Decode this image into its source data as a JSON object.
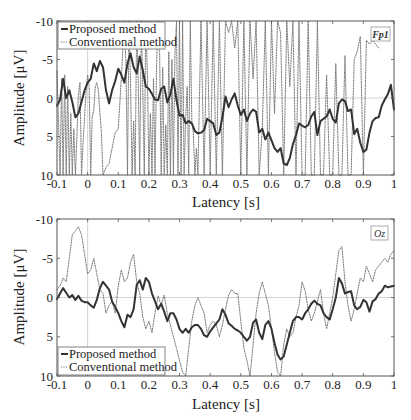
{
  "chart_data": [
    {
      "type": "line",
      "panel": "top",
      "channel_label": "Fp1",
      "xlabel": "Latency [s]",
      "ylabel": "Amplitude [μV]",
      "xlim": [
        -0.1,
        1.0
      ],
      "ylim": [
        -10,
        10
      ],
      "y_reversed": true,
      "x_ticks": [
        -0.1,
        0,
        0.1,
        0.2,
        0.3,
        0.4,
        0.5,
        0.6,
        0.7,
        0.8,
        0.9,
        1
      ],
      "x_tick_labels": [
        "-0.1",
        "0",
        "0.1",
        "0.2",
        "0.3",
        "0.4",
        "0.5",
        "0.6",
        "0.7",
        "0.8",
        "0.9",
        "1"
      ],
      "y_ticks": [
        -10,
        -5,
        0,
        5,
        10
      ],
      "y_tick_labels": [
        "-10",
        "-5",
        "0",
        "5",
        "10"
      ],
      "grid": "zero-lines",
      "legend_position": "upper left",
      "series": [
        {
          "name": "Proposed method",
          "style": "solid",
          "x": [
            -0.1,
            -0.09,
            -0.08,
            -0.07,
            -0.06,
            -0.05,
            -0.04,
            -0.03,
            -0.02,
            -0.01,
            0,
            0.01,
            0.02,
            0.03,
            0.04,
            0.05,
            0.06,
            0.07,
            0.08,
            0.09,
            0.1,
            0.11,
            0.12,
            0.13,
            0.14,
            0.15,
            0.16,
            0.17,
            0.18,
            0.19,
            0.2,
            0.21,
            0.22,
            0.23,
            0.24,
            0.25,
            0.26,
            0.27,
            0.28,
            0.29,
            0.3,
            0.31,
            0.32,
            0.33,
            0.34,
            0.35,
            0.36,
            0.37,
            0.38,
            0.39,
            0.4,
            0.41,
            0.42,
            0.43,
            0.44,
            0.45,
            0.46,
            0.47,
            0.48,
            0.49,
            0.5,
            0.51,
            0.52,
            0.53,
            0.54,
            0.55,
            0.56,
            0.57,
            0.58,
            0.59,
            0.6,
            0.61,
            0.62,
            0.63,
            0.64,
            0.65,
            0.66,
            0.67,
            0.68,
            0.69,
            0.7,
            0.71,
            0.72,
            0.73,
            0.74,
            0.75,
            0.76,
            0.77,
            0.78,
            0.79,
            0.8,
            0.81,
            0.82,
            0.83,
            0.84,
            0.85,
            0.86,
            0.87,
            0.88,
            0.89,
            0.9,
            0.91,
            0.92,
            0.93,
            0.94,
            0.95,
            0.96,
            0.97,
            0.98,
            0.99,
            1.0
          ],
          "y": [
            1.0,
            0.2,
            -2.5,
            0.0,
            -1.0,
            0.5,
            2.5,
            2.0,
            0.5,
            -1.0,
            -2.0,
            -2.5,
            -4.5,
            -3.5,
            -4.8,
            -4.0,
            -1.0,
            0.7,
            -1.0,
            -2.2,
            -3.8,
            -3.0,
            -2.0,
            -4.5,
            -5.8,
            -4.0,
            -3.2,
            -5.4,
            -3.6,
            -1.5,
            -1.2,
            -0.5,
            0.2,
            0.3,
            -1.2,
            -1.5,
            0.6,
            -0.5,
            -2.5,
            0.3,
            2.3,
            2.2,
            3.3,
            3.0,
            3.3,
            4.3,
            4.6,
            4.5,
            4.2,
            2.7,
            3.0,
            3.3,
            4.8,
            4.5,
            2.5,
            -0.2,
            1.2,
            0.2,
            -0.6,
            1.0,
            2.2,
            1.5,
            3.0,
            2.0,
            1.5,
            1.8,
            4.5,
            4.0,
            5.4,
            4.5,
            5.5,
            6.5,
            7.0,
            6.5,
            8.5,
            8.7,
            7.8,
            6.0,
            4.8,
            3.3,
            3.6,
            3.8,
            3.5,
            2.4,
            1.8,
            4.8,
            3.0,
            2.7,
            2.4,
            1.5,
            2.7,
            3.2,
            0.7,
            0.2,
            0.4,
            1.7,
            1.5,
            4.7,
            4.0,
            5.8,
            7.0,
            6.7,
            4.5,
            3.0,
            2.6,
            2.5,
            1.0,
            0.2,
            -0.5,
            -1.7,
            1.5
          ]
        },
        {
          "name": "Conventional method",
          "style": "dotted",
          "description": "highly oscillatory, frequently clipped at both axis limits",
          "x": [
            -0.1,
            -0.09,
            -0.085,
            -0.08,
            -0.075,
            -0.07,
            -0.065,
            -0.06,
            -0.055,
            -0.05,
            -0.045,
            -0.04,
            -0.035,
            -0.03,
            -0.025,
            -0.02,
            -0.015,
            -0.01,
            -0.005,
            0,
            0.005,
            0.01,
            0.015,
            0.02,
            0.025,
            0.03,
            0.035,
            0.04,
            0.045,
            0.05,
            0.06,
            0.07,
            0.08,
            0.09,
            0.1,
            0.11,
            0.12,
            0.125,
            0.13,
            0.135,
            0.14,
            0.145,
            0.15,
            0.155,
            0.16,
            0.165,
            0.17,
            0.175,
            0.18,
            0.185,
            0.19,
            0.195,
            0.2,
            0.205,
            0.21,
            0.215,
            0.22,
            0.225,
            0.23,
            0.235,
            0.24,
            0.245,
            0.25,
            0.255,
            0.26,
            0.265,
            0.27,
            0.275,
            0.28,
            0.285,
            0.29,
            0.295,
            0.3,
            0.305,
            0.31,
            0.315,
            0.32,
            0.325,
            0.33,
            0.335,
            0.34,
            0.345,
            0.35,
            0.355,
            0.36,
            0.37,
            0.38,
            0.39,
            0.4,
            0.41,
            0.42,
            0.43,
            0.44,
            0.45,
            0.46,
            0.47,
            0.48,
            0.49,
            0.5,
            0.51,
            0.52,
            0.53,
            0.54,
            0.55,
            0.56,
            0.57,
            0.58,
            0.59,
            0.6,
            0.61,
            0.62,
            0.63,
            0.64,
            0.65,
            0.66,
            0.67,
            0.68,
            0.69,
            0.7,
            0.71,
            0.72,
            0.73,
            0.74,
            0.75,
            0.76,
            0.77,
            0.78,
            0.79,
            0.8,
            0.81,
            0.82,
            0.83,
            0.84,
            0.85,
            0.86,
            0.87,
            0.88,
            0.89,
            0.9,
            0.91,
            0.92,
            0.93,
            0.94,
            0.95,
            0.96,
            0.97,
            0.98,
            0.99,
            1.0
          ],
          "y": [
            -3.5,
            10,
            -2.5,
            10,
            -3.0,
            10,
            -1.5,
            10,
            2.0,
            10,
            4.0,
            10,
            5.0,
            -0.5,
            -2.0,
            10,
            6.0,
            2.5,
            -1.0,
            -3.0,
            -1.5,
            10,
            2.5,
            1.5,
            -1.5,
            -2.0,
            -1.0,
            2.0,
            4.5,
            10,
            9.0,
            8.5,
            6.5,
            4.5,
            4.0,
            -2.5,
            -10,
            -4.5,
            10,
            -10,
            -2.0,
            10,
            3.0,
            10,
            -10,
            -2.5,
            10,
            -10,
            -1.0,
            10,
            -10,
            -3.0,
            10,
            2.0,
            10,
            -2.5,
            10,
            -4.5,
            -10,
            -6.0,
            10,
            -4.0,
            10,
            3.5,
            10,
            -6.0,
            10,
            -5.0,
            10,
            -5.5,
            -10,
            10,
            -10,
            10,
            -10,
            10,
            2.5,
            -1.5,
            10,
            -10,
            3.0,
            4.5,
            10,
            6.5,
            10,
            -10,
            10,
            -10,
            10,
            -10,
            10,
            -10,
            10,
            -10,
            -8.5,
            -10,
            -6.5,
            -10,
            10,
            -10,
            10,
            -10,
            -2.5,
            -10,
            10,
            4.0,
            -10,
            10,
            -10,
            2.0,
            -10,
            -8.5,
            10,
            -10,
            -1.5,
            -10,
            10,
            -10,
            10,
            10,
            -10,
            10,
            10,
            -10,
            10,
            10,
            -3.0,
            10,
            10,
            -4.5,
            10,
            10,
            -5.5,
            10,
            10,
            -5.0,
            -6.0,
            -8.0,
            10,
            -7.5,
            -7.0,
            -7.5,
            -7.0,
            -6.5
          ]
        }
      ]
    },
    {
      "type": "line",
      "panel": "bottom",
      "channel_label": "Oz",
      "xlabel": "Latency [s]",
      "ylabel": "Amplitude [μV]",
      "xlim": [
        -0.1,
        1.0
      ],
      "ylim": [
        -10,
        10
      ],
      "y_reversed": true,
      "x_ticks": [
        -0.1,
        0,
        0.1,
        0.2,
        0.3,
        0.4,
        0.5,
        0.6,
        0.7,
        0.8,
        0.9,
        1
      ],
      "x_tick_labels": [
        "-0.1",
        "0",
        "0.1",
        "0.2",
        "0.3",
        "0.4",
        "0.5",
        "0.6",
        "0.7",
        "0.8",
        "0.9",
        "1"
      ],
      "y_ticks": [
        -10,
        -5,
        0,
        5,
        10
      ],
      "y_tick_labels": [
        "-10",
        "-5",
        "0",
        "5",
        "10"
      ],
      "grid": "zero-lines",
      "legend_position": "lower left",
      "series": [
        {
          "name": "Proposed method",
          "style": "solid",
          "x": [
            -0.1,
            -0.09,
            -0.08,
            -0.07,
            -0.06,
            -0.05,
            -0.04,
            -0.03,
            -0.02,
            -0.01,
            0,
            0.01,
            0.02,
            0.03,
            0.04,
            0.05,
            0.06,
            0.07,
            0.08,
            0.09,
            0.1,
            0.11,
            0.12,
            0.13,
            0.14,
            0.15,
            0.16,
            0.17,
            0.18,
            0.19,
            0.2,
            0.21,
            0.22,
            0.23,
            0.24,
            0.25,
            0.26,
            0.27,
            0.28,
            0.29,
            0.3,
            0.31,
            0.32,
            0.33,
            0.34,
            0.35,
            0.36,
            0.37,
            0.38,
            0.39,
            0.4,
            0.41,
            0.42,
            0.43,
            0.44,
            0.45,
            0.46,
            0.47,
            0.48,
            0.49,
            0.5,
            0.51,
            0.52,
            0.53,
            0.54,
            0.55,
            0.56,
            0.57,
            0.58,
            0.59,
            0.6,
            0.61,
            0.62,
            0.63,
            0.64,
            0.65,
            0.66,
            0.67,
            0.68,
            0.69,
            0.7,
            0.71,
            0.72,
            0.73,
            0.74,
            0.75,
            0.76,
            0.77,
            0.78,
            0.79,
            0.8,
            0.81,
            0.82,
            0.83,
            0.84,
            0.85,
            0.86,
            0.87,
            0.88,
            0.89,
            0.9,
            0.91,
            0.92,
            0.93,
            0.94,
            0.95,
            0.96,
            0.97,
            0.98,
            0.99,
            1.0
          ],
          "y": [
            0.2,
            -0.5,
            -1.2,
            -0.6,
            0.0,
            -0.3,
            0.3,
            -0.2,
            0.4,
            0.6,
            0.6,
            1.0,
            1.3,
            0.3,
            -1.2,
            -2.0,
            -1.5,
            -1.0,
            0.5,
            1.2,
            2.0,
            3.0,
            3.8,
            2.2,
            2.5,
            1.5,
            -1.6,
            -2.2,
            -1.0,
            -2.5,
            -2.0,
            -0.5,
            0.5,
            1.5,
            0.8,
            1.8,
            3.0,
            2.0,
            2.0,
            2.8,
            4.0,
            4.5,
            4.0,
            4.5,
            3.8,
            3.5,
            3.5,
            4.0,
            4.8,
            5.0,
            4.3,
            3.8,
            3.3,
            2.8,
            1.5,
            2.2,
            3.3,
            3.6,
            4.0,
            4.2,
            4.5,
            5.0,
            5.5,
            5.0,
            3.2,
            2.8,
            4.5,
            5.3,
            3.5,
            3.0,
            4.0,
            5.8,
            7.3,
            7.9,
            7.5,
            6.0,
            4.5,
            3.0,
            2.5,
            2.5,
            2.8,
            2.0,
            1.5,
            0.8,
            0.4,
            0.8,
            1.0,
            2.0,
            2.5,
            2.8,
            1.5,
            0.0,
            -2.5,
            -1.8,
            -0.5,
            -0.7,
            -0.8,
            1.0,
            1.5,
            1.2,
            0.3,
            0.6,
            1.8,
            0.5,
            0.2,
            -0.5,
            -0.8,
            -1.5,
            -1.3,
            -1.4,
            -1.5,
            -1.2,
            -1.0,
            0.2,
            0.6,
            -0.4
          ]
        },
        {
          "name": "Conventional method",
          "style": "dotted",
          "x": [
            -0.1,
            -0.09,
            -0.08,
            -0.07,
            -0.06,
            -0.05,
            -0.04,
            -0.03,
            -0.02,
            -0.01,
            0,
            0.01,
            0.02,
            0.03,
            0.04,
            0.05,
            0.06,
            0.07,
            0.08,
            0.09,
            0.1,
            0.11,
            0.12,
            0.13,
            0.14,
            0.15,
            0.16,
            0.17,
            0.18,
            0.19,
            0.2,
            0.21,
            0.22,
            0.23,
            0.24,
            0.25,
            0.26,
            0.27,
            0.28,
            0.29,
            0.3,
            0.31,
            0.32,
            0.33,
            0.34,
            0.35,
            0.36,
            0.37,
            0.38,
            0.39,
            0.4,
            0.41,
            0.42,
            0.43,
            0.44,
            0.45,
            0.46,
            0.47,
            0.48,
            0.49,
            0.5,
            0.51,
            0.52,
            0.53,
            0.54,
            0.55,
            0.56,
            0.57,
            0.58,
            0.59,
            0.6,
            0.61,
            0.62,
            0.63,
            0.64,
            0.65,
            0.66,
            0.67,
            0.68,
            0.69,
            0.7,
            0.71,
            0.72,
            0.73,
            0.74,
            0.75,
            0.76,
            0.77,
            0.78,
            0.79,
            0.8,
            0.81,
            0.82,
            0.83,
            0.84,
            0.85,
            0.86,
            0.87,
            0.88,
            0.89,
            0.9,
            0.91,
            0.92,
            0.93,
            0.94,
            0.95,
            0.96,
            0.97,
            0.98,
            0.99,
            1.0
          ],
          "y": [
            -1.0,
            -1.5,
            -2.5,
            -2.0,
            -5.0,
            -8.0,
            -8.5,
            -9.0,
            -8.0,
            -5.5,
            -3.0,
            -3.5,
            -5.0,
            -3.0,
            -1.0,
            -0.5,
            2.0,
            1.0,
            0.5,
            2.0,
            -1.5,
            -3.5,
            -2.0,
            -2.5,
            -4.5,
            -5.5,
            -2.0,
            -0.5,
            2.5,
            4.0,
            3.0,
            4.5,
            2.0,
            -0.2,
            1.0,
            -0.3,
            2.0,
            3.5,
            5.0,
            6.5,
            8.0,
            9.5,
            10.0,
            6.5,
            3.0,
            1.0,
            0.0,
            1.0,
            2.0,
            4.5,
            3.5,
            3.0,
            3.5,
            5.0,
            3.5,
            1.5,
            -0.3,
            -1.0,
            -0.5,
            -0.5,
            3.0,
            6.5,
            8.0,
            10,
            6.0,
            2.0,
            -0.5,
            -2.0,
            -0.5,
            1.0,
            4.0,
            7.0,
            9.5,
            10,
            6.0,
            4.0,
            5.0,
            4.5,
            2.5,
            1.0,
            -2.0,
            -0.8,
            1.5,
            3.0,
            2.0,
            0.5,
            -1.0,
            2.0,
            4.0,
            2.0,
            0.0,
            -3.0,
            -6.0,
            -6.5,
            -2.0,
            1.0,
            3.0,
            1.5,
            -0.5,
            -2.5,
            -2.0,
            -4.0,
            -3.0,
            -2.0,
            -3.5,
            -4.0,
            -4.5,
            -5.0,
            -4.5,
            -5.5,
            -6.0,
            -5.0,
            -6.0,
            -7.5,
            -3.0
          ]
        }
      ]
    }
  ],
  "legend": {
    "proposed_label": "Proposed method",
    "conventional_label": "Conventional method"
  },
  "colors": {
    "proposed": "#333333",
    "conventional": "#7a7a7a",
    "axis": "#555555",
    "zero_line": "#c8c8c8"
  }
}
